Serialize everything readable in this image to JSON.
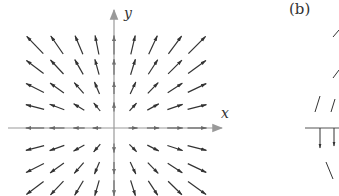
{
  "figure": {
    "panel_a": {
      "x_axis_label": "x",
      "y_axis_label": "y",
      "field_description": "radial outward vector field F(x,y) = <x, y>",
      "origin_px": [
        114,
        128
      ],
      "columns_px": [
        35,
        57,
        79,
        97,
        114,
        133,
        153,
        175,
        197
      ],
      "rows_px": [
        45,
        67,
        88,
        107,
        128,
        148,
        168,
        188
      ],
      "colors": {
        "axis": "#888888",
        "arrow": "#333333",
        "label": "#333333"
      }
    },
    "panel_b": {
      "label": "(b)",
      "partially_visible": true
    }
  }
}
